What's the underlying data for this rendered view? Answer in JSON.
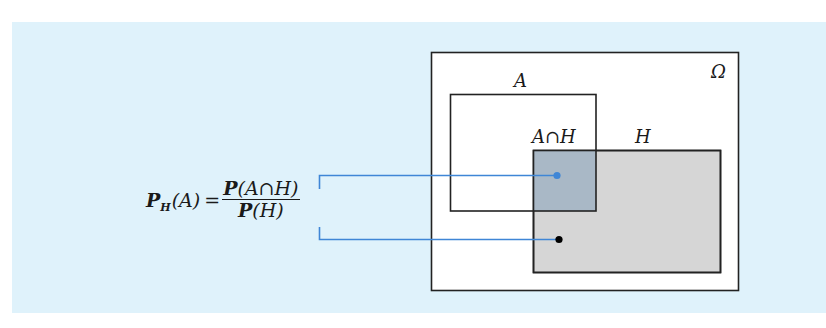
{
  "formula": {
    "lhs_symbol": "P",
    "lhs_subscript": "H",
    "lhs_arg": "(A)",
    "equals": "=",
    "numerator_symbol": "P",
    "numerator_arg": "(A∩H)",
    "denominator_symbol": "P",
    "denominator_arg": "(H)"
  },
  "diagram": {
    "labels": {
      "omega": "Ω",
      "set_a": "A",
      "intersection": "A∩H",
      "set_h": "H"
    },
    "colors": {
      "panel_background": "#dff2fb",
      "omega_fill": "#ffffff",
      "h_fill": "#d6d6d6",
      "intersection_fill": "#a9b8c6",
      "outline": "#222222",
      "connector": "#3f86d6",
      "dot_blue": "#3f86d6",
      "dot_black": "#000000"
    }
  }
}
